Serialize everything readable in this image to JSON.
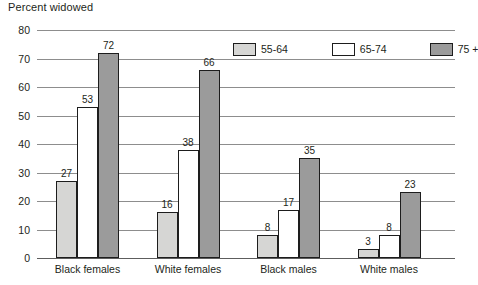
{
  "chart_data": {
    "type": "bar",
    "title": "Percent widowed",
    "xlabel": "",
    "ylabel": "",
    "ylim": [
      0,
      80
    ],
    "yticks": [
      0,
      10,
      20,
      30,
      40,
      50,
      60,
      70,
      80
    ],
    "grid": true,
    "legend_position": "top-center",
    "categories": [
      "Black females",
      "White females",
      "Black males",
      "White males"
    ],
    "series": [
      {
        "name": "55-64",
        "color": "#d6d6d4",
        "values": [
          27,
          16,
          8,
          3
        ]
      },
      {
        "name": "65-74",
        "color": "#ffffff",
        "values": [
          53,
          38,
          17,
          8
        ]
      },
      {
        "name": "75 +",
        "color": "#9b9b9b",
        "values": [
          72,
          66,
          35,
          23
        ]
      }
    ]
  }
}
